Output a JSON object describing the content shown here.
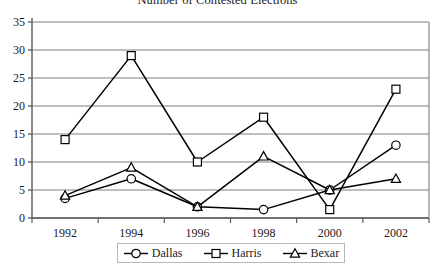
{
  "chart_data": {
    "type": "line",
    "title": "Number of Contested Elections",
    "xlabel": "",
    "ylabel": "",
    "categories": [
      "1992",
      "1994",
      "1996",
      "1998",
      "2000",
      "2002"
    ],
    "series": [
      {
        "name": "Dallas",
        "marker": "circle",
        "values": [
          3.5,
          7,
          2,
          1.5,
          5,
          13
        ]
      },
      {
        "name": "Harris",
        "marker": "square",
        "values": [
          14,
          29,
          10,
          18,
          1.5,
          23
        ]
      },
      {
        "name": "Bexar",
        "marker": "triangle",
        "values": [
          4,
          9,
          2,
          11,
          5,
          7
        ]
      }
    ],
    "ylim": [
      0,
      35
    ],
    "yticks": [
      0,
      5,
      10,
      15,
      20,
      25,
      30,
      35
    ],
    "ytick_labels": [
      "0",
      "5",
      "10",
      "15",
      "20",
      "25",
      "30",
      "35"
    ],
    "grid": "horizontal",
    "legend_position": "bottom",
    "colors": {
      "line": "#000000",
      "grid": "#808080",
      "axis": "#595959",
      "plot_background": "#ffffff",
      "legend_border": "#b8b8b8"
    }
  },
  "legend": {
    "items": [
      {
        "label": "Dallas",
        "marker": "circle-marker-icon"
      },
      {
        "label": "Harris",
        "marker": "square-marker-icon"
      },
      {
        "label": "Bexar",
        "marker": "triangle-marker-icon"
      }
    ]
  }
}
